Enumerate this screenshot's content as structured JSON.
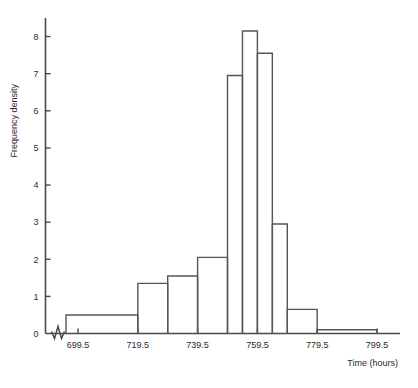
{
  "chart_data": {
    "type": "bar",
    "title": "",
    "subtitle": "",
    "xlabel": "Time (hours)",
    "ylabel": "Frequency density",
    "grid": false,
    "legend": null,
    "axis_break_x": true,
    "xlim": [
      695.5,
      801.5
    ],
    "ylim": [
      0,
      8.5
    ],
    "xticks": [
      699.5,
      719.5,
      739.5,
      759.5,
      779.5,
      799.5
    ],
    "xticklabels": [
      "699.5",
      "719.5",
      "739.5",
      "759.5",
      "779.5",
      "799.5"
    ],
    "yticks": [
      0,
      1,
      2,
      3,
      4,
      5,
      6,
      7,
      8
    ],
    "yticklabels": [
      "0",
      "1",
      "2",
      "3",
      "4",
      "5",
      "6",
      "7",
      "8"
    ],
    "bins": [
      {
        "start": 695.5,
        "end": 719.5,
        "density": 0.5
      },
      {
        "start": 719.5,
        "end": 729.5,
        "density": 1.35
      },
      {
        "start": 729.5,
        "end": 739.5,
        "density": 1.55
      },
      {
        "start": 739.5,
        "end": 749.5,
        "density": 2.05
      },
      {
        "start": 749.5,
        "end": 754.5,
        "density": 6.95
      },
      {
        "start": 754.5,
        "end": 759.5,
        "density": 8.15
      },
      {
        "start": 759.5,
        "end": 764.5,
        "density": 7.55
      },
      {
        "start": 764.5,
        "end": 769.5,
        "density": 2.95
      },
      {
        "start": 769.5,
        "end": 779.5,
        "density": 0.65
      },
      {
        "start": 779.5,
        "end": 799.5,
        "density": 0.1
      }
    ],
    "colors": {
      "bar_stroke": "#555555",
      "bar_fill": "none",
      "axis": "#4a4a4a",
      "text": "#2b2b2b",
      "background": "#ffffff"
    }
  }
}
